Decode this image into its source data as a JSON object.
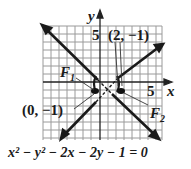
{
  "figure": {
    "type": "hyperbola-graph",
    "equation": "x² − y² − 2x − 2y − 1 = 0",
    "axes": {
      "x_label": "x",
      "y_label": "y",
      "x_tick_label": "5",
      "y_tick_label": "5"
    },
    "labels": {
      "vertex_right": "(2, −1)",
      "vertex_left": "(0, −1)",
      "focus_1": "F",
      "focus_1_sub": "1",
      "focus_2": "F",
      "focus_2_sub": "2"
    },
    "colors": {
      "grid": "#9a9a9a",
      "axis": "#222222",
      "curve": "#1a1a1a",
      "background": "#ffffff"
    }
  }
}
